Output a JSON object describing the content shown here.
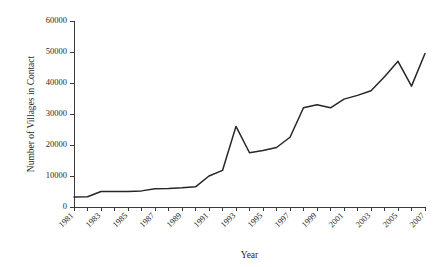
{
  "chart_data": {
    "type": "line",
    "title": "",
    "subtitle": "",
    "xlabel": "Year",
    "ylabel": "Number of Villages in Contact",
    "x": [
      1981,
      1982,
      1983,
      1984,
      1985,
      1986,
      1987,
      1988,
      1989,
      1990,
      1991,
      1992,
      1993,
      1994,
      1995,
      1996,
      1997,
      1998,
      1999,
      2000,
      2001,
      2002,
      2003,
      2004,
      2005,
      2006,
      2007
    ],
    "values": [
      3200,
      3300,
      5000,
      5000,
      5000,
      5200,
      5900,
      6000,
      6200,
      6500,
      10000,
      11800,
      26000,
      17500,
      18200,
      19200,
      22500,
      32000,
      33000,
      32000,
      34800,
      36000,
      37500,
      42000,
      47000,
      39000,
      49500
    ],
    "series": [
      {
        "name": "Villages in Contact",
        "color": "#262626",
        "values": [
          3200,
          3300,
          5000,
          5000,
          5000,
          5200,
          5900,
          6000,
          6200,
          6500,
          10000,
          11800,
          26000,
          17500,
          18200,
          19200,
          22500,
          32000,
          33000,
          32000,
          34800,
          36000,
          37500,
          42000,
          47000,
          39000,
          49500
        ]
      }
    ],
    "ylim": [
      0,
      60000
    ],
    "xlim": [
      1981,
      2007
    ],
    "ytick_labels": [
      "0",
      "10000",
      "20000",
      "30000",
      "40000",
      "50000",
      "60000"
    ],
    "ytick_values": [
      0,
      10000,
      20000,
      30000,
      40000,
      50000,
      60000
    ],
    "xtick_labels": [
      "1981",
      "1983",
      "1985",
      "1987",
      "1989",
      "1991",
      "1993",
      "1995",
      "1997",
      "1999",
      "2001",
      "2003",
      "2005",
      "2007"
    ],
    "xtick_values": [
      1981,
      1983,
      1985,
      1987,
      1989,
      1991,
      1993,
      1995,
      1997,
      1999,
      2001,
      2003,
      2005,
      2007
    ],
    "minor_xtick_values": [
      1981,
      1982,
      1983,
      1984,
      1985,
      1986,
      1987,
      1988,
      1989,
      1990,
      1991,
      1992,
      1993,
      1994,
      1995,
      1996,
      1997,
      1998,
      1999,
      2000,
      2001,
      2002,
      2003,
      2004,
      2005,
      2006,
      2007
    ],
    "grid": false,
    "legend": "none",
    "xtick_rotation_deg": -45,
    "line_color": "#262626",
    "axis_color": "#3a3a3a",
    "background_color": "#ffffff"
  }
}
